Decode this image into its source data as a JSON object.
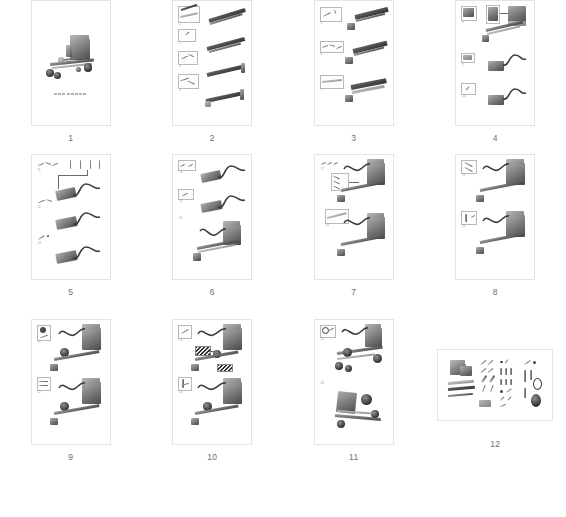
{
  "document": {
    "type": "assembly-instruction-manual-thumbnails",
    "layout": "4-column grid",
    "page_count": 12,
    "background_color": "#ffffff",
    "thumbnail_border_color": "#e4e4e4",
    "number_color": "#6e6e6e",
    "ink_color": "#4a4a4a"
  },
  "pages": [
    {
      "number": "1",
      "orientation": "portrait",
      "content": "finished-assembly-overview",
      "caption": "",
      "steps": []
    },
    {
      "number": "2",
      "orientation": "portrait",
      "content": "frame-rail-assembly",
      "caption": "",
      "steps": [
        "1",
        "2",
        "3",
        "4"
      ]
    },
    {
      "number": "3",
      "orientation": "portrait",
      "content": "rail-extension-assembly",
      "caption": "",
      "steps": [
        "5",
        "6",
        "7"
      ]
    },
    {
      "number": "4",
      "orientation": "portrait",
      "content": "motor-block-and-cable-assembly",
      "caption": "",
      "steps": [
        "8",
        "9",
        "10"
      ]
    },
    {
      "number": "5",
      "orientation": "portrait",
      "content": "cable-routing-with-part-callouts",
      "caption": "",
      "steps": [
        "11",
        "12",
        "13"
      ]
    },
    {
      "number": "6",
      "orientation": "portrait",
      "content": "cable-unit-mounted-to-frame",
      "caption": "",
      "steps": [
        "14",
        "15",
        "16"
      ]
    },
    {
      "number": "7",
      "orientation": "portrait",
      "content": "body-mount-with-fastener-callouts",
      "caption": "",
      "steps": [
        "17",
        "18"
      ]
    },
    {
      "number": "8",
      "orientation": "portrait",
      "content": "body-detail-attachment",
      "caption": "",
      "steps": [
        "19",
        "20"
      ]
    },
    {
      "number": "9",
      "orientation": "portrait",
      "content": "front-wheel-hub-attachment",
      "caption": "",
      "steps": [
        "21",
        "22"
      ]
    },
    {
      "number": "10",
      "orientation": "portrait",
      "content": "decal-and-trim-application",
      "caption": "",
      "steps": [
        "23",
        "24"
      ]
    },
    {
      "number": "11",
      "orientation": "portrait",
      "content": "final-wheel-and-axle-assembly",
      "caption": "",
      "steps": [
        "25",
        "26"
      ]
    },
    {
      "number": "12",
      "orientation": "landscape",
      "content": "parts-inventory-exploded-list",
      "caption": "",
      "steps": []
    }
  ]
}
